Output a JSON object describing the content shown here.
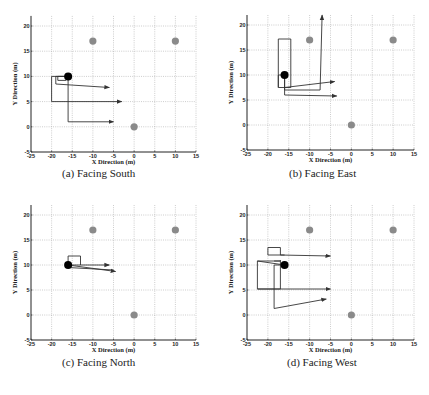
{
  "figure": {
    "panels": [
      {
        "id": "a",
        "caption": "(a) Facing South"
      },
      {
        "id": "b",
        "caption": "(b) Facing East"
      },
      {
        "id": "c",
        "caption": "(c) Facing North"
      },
      {
        "id": "d",
        "caption": "(d) Facing West"
      }
    ]
  },
  "chart_data": [
    {
      "type": "line",
      "title": "(a) Facing South",
      "xlabel": "X Direction (m)",
      "ylabel": "Y Direction (m)",
      "xlim": [
        -25,
        15
      ],
      "ylim": [
        -5,
        22
      ],
      "xticks": [
        -25,
        -20,
        -15,
        -10,
        -5,
        0,
        5,
        10,
        15
      ],
      "yticks": [
        -5,
        0,
        5,
        10,
        15,
        20
      ],
      "grid": true,
      "landmarks": [
        {
          "x": -10,
          "y": 17
        },
        {
          "x": 10,
          "y": 17
        },
        {
          "x": 0,
          "y": 0
        }
      ],
      "robot": {
        "x": -16,
        "y": 10
      },
      "paths": [
        {
          "points": [
            [
              -16,
              10
            ],
            [
              -16,
              1
            ],
            [
              -5,
              1
            ]
          ],
          "arrow": true
        },
        {
          "points": [
            [
              -16,
              10
            ],
            [
              -20,
              10
            ],
            [
              -20,
              5
            ],
            [
              -3,
              5
            ]
          ],
          "arrow": true
        },
        {
          "points": [
            [
              -16,
              10
            ],
            [
              -19,
              10
            ],
            [
              -19,
              8.5
            ],
            [
              -6,
              7.8
            ]
          ],
          "arrow": true
        },
        {
          "points": [
            [
              -16,
              10
            ],
            [
              -18.5,
              10
            ],
            [
              -18.5,
              9.2
            ],
            [
              -16.5,
              9.2
            ]
          ],
          "arrow": false
        }
      ]
    },
    {
      "type": "line",
      "title": "(b) Facing East",
      "xlabel": "X Direction (m)",
      "ylabel": "Y Direction (m)",
      "xlim": [
        -25,
        15
      ],
      "ylim": [
        -5,
        22
      ],
      "xticks": [
        -25,
        -20,
        -15,
        -10,
        -5,
        0,
        5,
        10,
        15
      ],
      "yticks": [
        -5,
        0,
        5,
        10,
        15,
        20
      ],
      "grid": true,
      "landmarks": [
        {
          "x": -10,
          "y": 17
        },
        {
          "x": 10,
          "y": 17
        },
        {
          "x": 0,
          "y": 0
        }
      ],
      "robot": {
        "x": -16,
        "y": 10
      },
      "paths": [
        {
          "points": [
            [
              -16,
              10
            ],
            [
              -16,
              6
            ],
            [
              -3.5,
              5.8
            ]
          ],
          "arrow": true
        },
        {
          "points": [
            [
              -16,
              10
            ],
            [
              -16,
              7
            ],
            [
              -7.5,
              7
            ],
            [
              -7,
              22
            ]
          ],
          "arrow": true
        },
        {
          "points": [
            [
              -16,
              10
            ],
            [
              -17.5,
              10
            ],
            [
              -17.5,
              7.5
            ],
            [
              -14.5,
              7.5
            ],
            [
              -14.5,
              17.2
            ],
            [
              -17.5,
              17.2
            ],
            [
              -17.5,
              7.5
            ]
          ],
          "arrow": false
        },
        {
          "points": [
            [
              -16,
              7.5
            ],
            [
              -4,
              8.7
            ]
          ],
          "arrow": true
        }
      ]
    },
    {
      "type": "line",
      "title": "(c) Facing North",
      "xlabel": "X Direction (m)",
      "ylabel": "Y Direction (m)",
      "xlim": [
        -25,
        15
      ],
      "ylim": [
        -5,
        22
      ],
      "xticks": [
        -25,
        -20,
        -15,
        -10,
        -5,
        0,
        5,
        10,
        15
      ],
      "yticks": [
        -5,
        0,
        5,
        10,
        15,
        20
      ],
      "grid": true,
      "landmarks": [
        {
          "x": -10,
          "y": 17
        },
        {
          "x": 10,
          "y": 17
        },
        {
          "x": 0,
          "y": 0
        }
      ],
      "robot": {
        "x": -16,
        "y": 10
      },
      "paths": [
        {
          "points": [
            [
              -16,
              10
            ],
            [
              -6,
              10
            ]
          ],
          "arrow": true
        },
        {
          "points": [
            [
              -16,
              10
            ],
            [
              -4.5,
              8.7
            ]
          ],
          "arrow": true
        },
        {
          "points": [
            [
              -16,
              9.5
            ],
            [
              -5,
              9
            ]
          ],
          "arrow": false
        },
        {
          "points": [
            [
              -16,
              10
            ],
            [
              -16,
              11.8
            ],
            [
              -13,
              11.8
            ],
            [
              -13,
              10
            ]
          ],
          "arrow": false
        }
      ]
    },
    {
      "type": "line",
      "title": "(d) Facing West",
      "xlabel": "X Direction (m)",
      "ylabel": "Y Direction (m)",
      "xlim": [
        -25,
        15
      ],
      "ylim": [
        -5,
        22
      ],
      "xticks": [
        -25,
        -20,
        -15,
        -10,
        -5,
        0,
        5,
        10,
        15
      ],
      "yticks": [
        -5,
        0,
        5,
        10,
        15,
        20
      ],
      "grid": true,
      "landmarks": [
        {
          "x": -10,
          "y": 17
        },
        {
          "x": 10,
          "y": 17
        },
        {
          "x": 0,
          "y": 0
        }
      ],
      "robot": {
        "x": -16,
        "y": 10
      },
      "paths": [
        {
          "points": [
            [
              -16,
              10
            ],
            [
              -22.5,
              10.8
            ],
            [
              -22.5,
              5.2
            ],
            [
              -17,
              5.2
            ],
            [
              -17,
              10.8
            ],
            [
              -22.5,
              10.8
            ]
          ],
          "arrow": false
        },
        {
          "points": [
            [
              -22.5,
              5.2
            ],
            [
              -5,
              5.2
            ]
          ],
          "arrow": true
        },
        {
          "points": [
            [
              -16,
              10
            ],
            [
              -18.5,
              10
            ],
            [
              -18.5,
              1.3
            ],
            [
              -6,
              3.2
            ]
          ],
          "arrow": true
        },
        {
          "points": [
            [
              -18.5,
              10.8
            ],
            [
              -17,
              10.8
            ],
            [
              -17,
              11
            ]
          ],
          "arrow": false
        },
        {
          "points": [
            [
              -16,
              12
            ],
            [
              -20,
              12
            ],
            [
              -20,
              13.5
            ],
            [
              -17,
              13.5
            ],
            [
              -17,
              12
            ],
            [
              -5,
              11.8
            ]
          ],
          "arrow": true
        }
      ]
    }
  ],
  "style": {
    "axis_color": "#222222",
    "grid_color": "#9a9a9a",
    "path_color": "#333333",
    "landmark_color": "#8a8a8a",
    "robot_color": "#000000",
    "panel_boxes": [
      {
        "left": 31,
        "right": 196,
        "top_y20": 26,
        "bottom": 152,
        "caption_x": 62,
        "caption_y": 175
      },
      {
        "left": 247,
        "right": 414,
        "top_y20": 25,
        "bottom": 150,
        "caption_x": 290,
        "caption_y": 175
      },
      {
        "left": 31,
        "right": 196,
        "top_y20": 215,
        "bottom": 340,
        "caption_x": 62,
        "caption_y": 363
      },
      {
        "left": 247,
        "right": 414,
        "top_y20": 215,
        "bottom": 340,
        "caption_x": 288,
        "caption_y": 363
      }
    ]
  }
}
